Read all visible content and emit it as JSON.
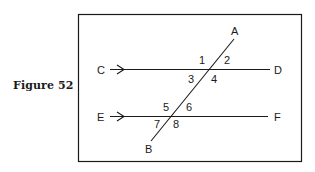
{
  "figure": {
    "caption": "Figure 52"
  },
  "diagram": {
    "type": "parallel-lines-cut-by-transversal",
    "stroke_color": "#1a1a1a",
    "lines": [
      {
        "name": "CD",
        "start_label": "C",
        "end_label": "D",
        "parallel_marker": "arrow"
      },
      {
        "name": "EF",
        "start_label": "E",
        "end_label": "F",
        "parallel_marker": "arrow"
      },
      {
        "name": "AB",
        "start_label": "A",
        "end_label": "B",
        "role": "transversal"
      }
    ],
    "points": {
      "A": "A",
      "B": "B",
      "C": "C",
      "D": "D",
      "E": "E",
      "F": "F"
    },
    "angles": {
      "a1": "1",
      "a2": "2",
      "a3": "3",
      "a4": "4",
      "a5": "5",
      "a6": "6",
      "a7": "7",
      "a8": "8"
    }
  }
}
